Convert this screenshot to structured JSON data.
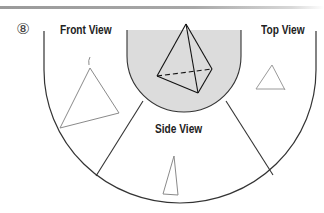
{
  "figure": {
    "number_label": "⑧",
    "colors": {
      "outline": "#333333",
      "sketch": "#8a8a8a",
      "shaded_region": "#dcdcdc",
      "label_text": "#222222",
      "top_rule": "#9a9a9a"
    }
  },
  "regions": {
    "front": {
      "label": "Front View",
      "sketch_shape": "triangle"
    },
    "top": {
      "label": "Top View",
      "sketch_shape": "triangle"
    },
    "side": {
      "label": "Side View",
      "sketch_shape": "narrow-triangle"
    },
    "center": {
      "object": "triangular-pyramid",
      "hidden_edge": "dashed"
    }
  }
}
